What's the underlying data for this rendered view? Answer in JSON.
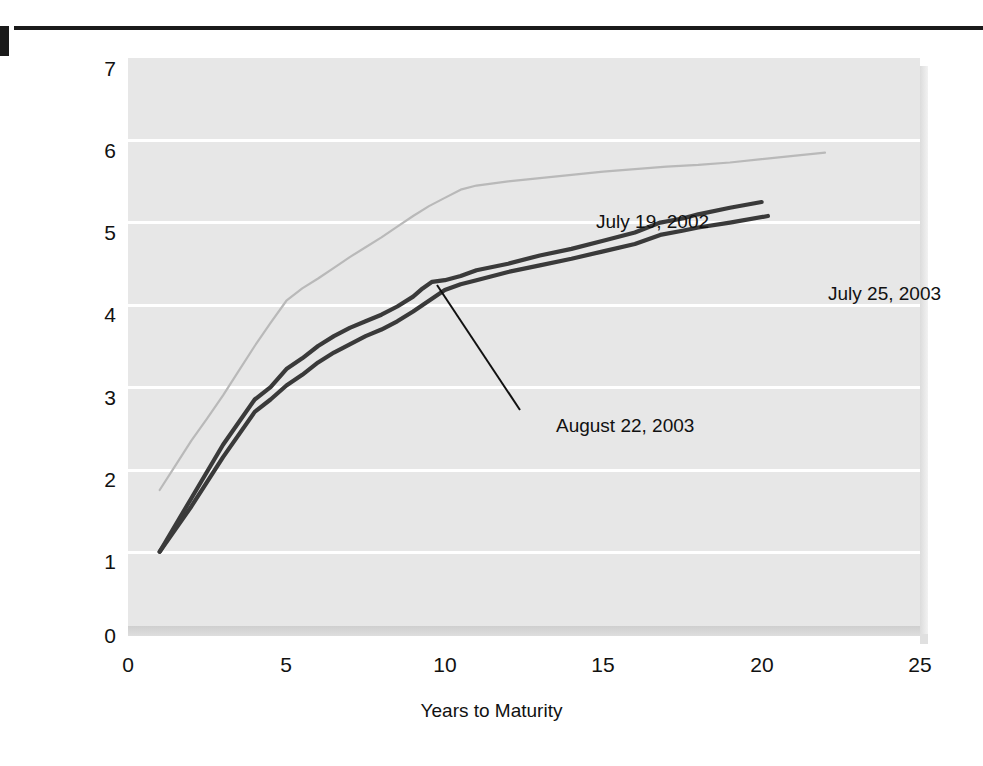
{
  "chart_data": {
    "type": "line",
    "title": "",
    "xlabel": "Years to Maturity",
    "ylabel": "Percent",
    "xlim": [
      0,
      25
    ],
    "ylim": [
      0,
      7
    ],
    "xticks": [
      "0",
      "5",
      "10",
      "15",
      "20",
      "25"
    ],
    "yticks": [
      "0",
      "1",
      "2",
      "3",
      "4",
      "5",
      "6",
      "7"
    ],
    "grid": "horizontal",
    "legend_position": "inline-annotations",
    "series": [
      {
        "name": "July 19, 2002",
        "color": "#b9b9b9",
        "x": [
          1.0,
          1.5,
          2.0,
          2.5,
          3.0,
          3.5,
          4.0,
          4.5,
          5.0,
          5.5,
          6.0,
          6.5,
          7.0,
          7.5,
          8.0,
          8.5,
          9.0,
          9.5,
          10.0,
          10.5,
          11.0,
          12.0,
          13.0,
          14.0,
          15.0,
          16.0,
          17.0,
          18.0,
          19.0,
          20.0,
          21.0,
          22.0
        ],
        "y": [
          1.75,
          2.05,
          2.35,
          2.62,
          2.9,
          3.2,
          3.5,
          3.78,
          4.05,
          4.2,
          4.32,
          4.45,
          4.58,
          4.7,
          4.82,
          4.95,
          5.08,
          5.2,
          5.3,
          5.4,
          5.45,
          5.5,
          5.54,
          5.58,
          5.62,
          5.65,
          5.68,
          5.7,
          5.73,
          5.77,
          5.81,
          5.85
        ]
      },
      {
        "name": "August 22, 2003",
        "color": "#3a3a3a",
        "x": [
          1.0,
          2.0,
          3.0,
          4.0,
          4.5,
          5.0,
          5.5,
          6.0,
          6.5,
          7.0,
          7.5,
          8.0,
          8.5,
          9.0,
          9.3,
          9.6,
          10.0,
          10.5,
          11.0,
          12.0,
          13.0,
          14.0,
          15.0,
          16.0,
          16.8,
          17.5,
          18.0,
          19.0,
          20.0
        ],
        "y": [
          1.0,
          1.65,
          2.3,
          2.85,
          3.0,
          3.22,
          3.35,
          3.5,
          3.62,
          3.72,
          3.8,
          3.88,
          3.98,
          4.1,
          4.2,
          4.28,
          4.3,
          4.35,
          4.42,
          4.5,
          4.6,
          4.68,
          4.78,
          4.88,
          5.0,
          5.05,
          5.1,
          5.18,
          5.25
        ]
      },
      {
        "name": "July 25, 2003",
        "color": "#3a3a3a",
        "x": [
          1.0,
          2.0,
          3.0,
          4.0,
          4.5,
          5.0,
          5.5,
          6.0,
          6.5,
          7.0,
          7.5,
          8.0,
          8.5,
          9.0,
          9.5,
          10.0,
          10.5,
          11.0,
          12.0,
          13.0,
          14.0,
          15.0,
          16.0,
          16.8,
          17.5,
          18.0,
          19.0,
          20.2
        ],
        "y": [
          1.0,
          1.55,
          2.15,
          2.7,
          2.85,
          3.02,
          3.15,
          3.3,
          3.42,
          3.52,
          3.62,
          3.7,
          3.8,
          3.92,
          4.05,
          4.18,
          4.25,
          4.3,
          4.4,
          4.48,
          4.56,
          4.65,
          4.74,
          4.85,
          4.9,
          4.94,
          5.0,
          5.08
        ]
      }
    ],
    "annotations": [
      {
        "text": "July 19, 2002",
        "for": "July 19, 2002"
      },
      {
        "text": "July 25, 2003",
        "for": "July 25, 2003"
      },
      {
        "text": "August 22, 2003",
        "for": "August 22, 2003",
        "leader_line": true
      }
    ],
    "colors": {
      "plot_background": "#e7e7e7",
      "gridline": "#ffffff",
      "dark_series": "#3a3a3a",
      "light_series": "#b9b9b9",
      "text": "#111111",
      "rule": "#1a1a1a"
    }
  }
}
